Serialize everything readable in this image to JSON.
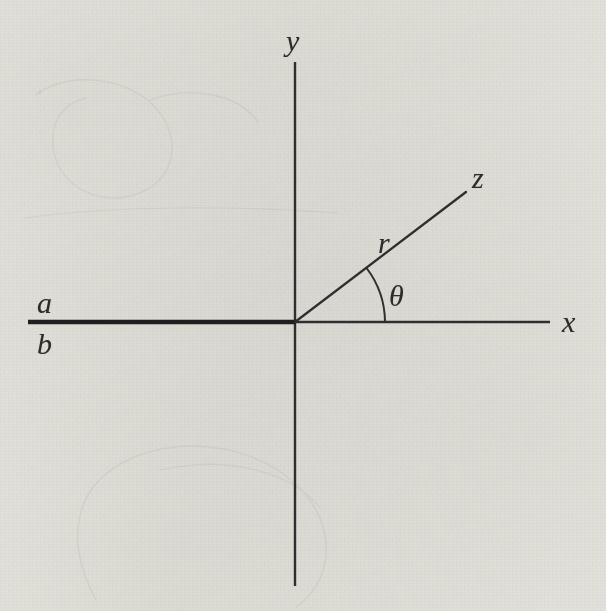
{
  "figure": {
    "type": "diagram",
    "background_color": "#f3f2ef",
    "ink_color": "#2c2c2c",
    "width": 606,
    "height": 611,
    "origin": {
      "x": 295,
      "y": 322
    },
    "axes": {
      "y_axis": {
        "label": "y",
        "label_x": 286,
        "label_y": 26,
        "x": 295,
        "y_top": 62,
        "y_bottom": 586,
        "stroke_width": 2.4
      },
      "x_axis": {
        "label": "x",
        "label_x": 562,
        "label_y": 307,
        "x_start": 295,
        "x_end": 550,
        "y": 322,
        "stroke_width": 2.4
      }
    },
    "segment_ab": {
      "upper_label": "a",
      "lower_label": "b",
      "upper_label_x": 37,
      "upper_label_y": 288,
      "lower_label_x": 37,
      "lower_label_y": 329,
      "x_start": 28,
      "x_end": 296,
      "y": 322,
      "stroke_width": 4.6
    },
    "ray_z": {
      "label": "z",
      "label_x": 472,
      "label_y": 163,
      "x_start": 295,
      "y_start": 322,
      "x_end": 466,
      "y_end": 192,
      "stroke_width": 2.3,
      "angle_degrees": 37
    },
    "radius_label": {
      "label": "r",
      "label_x": 378,
      "label_y": 228
    },
    "angle_arc": {
      "label": "θ",
      "label_x": 389,
      "label_y": 281,
      "radius": 90,
      "start_angle_degrees": 0,
      "end_angle_degrees": 37,
      "stroke_width": 2.0
    },
    "label_font_size": 30
  }
}
